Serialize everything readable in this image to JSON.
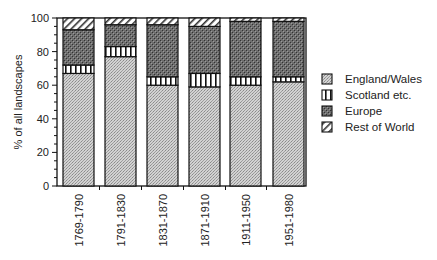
{
  "chart_data": {
    "type": "bar",
    "stacked": true,
    "title": "",
    "xlabel": "",
    "ylabel": "% of all landscapes",
    "ylim": [
      0,
      100
    ],
    "yticks": [
      0,
      20,
      40,
      60,
      80,
      100
    ],
    "grid": false,
    "legend_position": "right",
    "categories": [
      "1769-1790",
      "1791-1830",
      "1831-1870",
      "1871-1910",
      "1911-1950",
      "1951-1980"
    ],
    "series": [
      {
        "name": "England/Wales",
        "values": [
          67,
          77,
          60,
          59,
          60,
          62
        ],
        "pattern": "light-dots"
      },
      {
        "name": "Scotland etc.",
        "values": [
          5,
          6,
          5,
          8,
          5,
          3
        ],
        "pattern": "vertical-stripes"
      },
      {
        "name": "Europe",
        "values": [
          21,
          13,
          31,
          28,
          33,
          33
        ],
        "pattern": "dark-dots"
      },
      {
        "name": "Rest of World",
        "values": [
          7,
          4,
          4,
          5,
          2,
          2
        ],
        "pattern": "diagonal-hatch"
      }
    ]
  }
}
